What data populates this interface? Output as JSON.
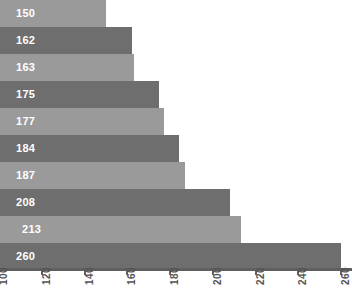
{
  "chart_data": {
    "type": "bar",
    "orientation": "horizontal",
    "title": "",
    "subtitle": "",
    "xlabel": "",
    "ylabel": "",
    "xlim": [
      100,
      260
    ],
    "grid": false,
    "legend": null,
    "categories": [
      "",
      "",
      "",
      "",
      "",
      "",
      "",
      "",
      "",
      ""
    ],
    "values": [
      150,
      162,
      163,
      175,
      177,
      184,
      187,
      208,
      213,
      260
    ],
    "data_labels": [
      "150",
      "162",
      "163",
      "175",
      "177",
      "184",
      "187",
      "208",
      "213",
      "260"
    ],
    "tick_labels": [
      "100",
      "120",
      "140",
      "160",
      "180",
      "200",
      "220",
      "240",
      "260"
    ],
    "tick_values": [
      100,
      120,
      140,
      160,
      180,
      200,
      220,
      240,
      260
    ],
    "bar_colors": [
      "#9a9a9a",
      "#6e6e6e",
      "#9a9a9a",
      "#6e6e6e",
      "#9a9a9a",
      "#6e6e6e",
      "#9a9a9a",
      "#6e6e6e",
      "#9a9a9a",
      "#6e6e6e"
    ],
    "label_color": "#ffffff",
    "axis_color": "#5f5f5f",
    "tick_label_color": "#555555",
    "background": "#ffffff",
    "tick_label_rotation": -90
  }
}
